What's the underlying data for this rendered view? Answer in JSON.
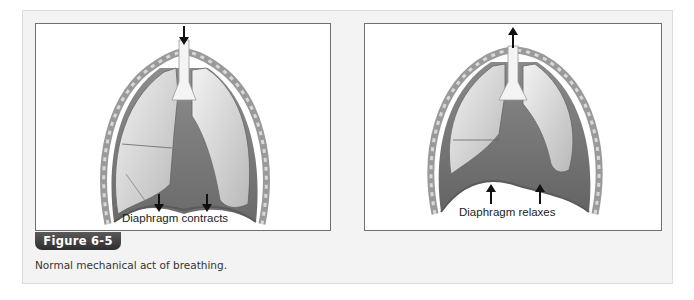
{
  "figure": {
    "number_label": "Figure 6-5",
    "caption": "Normal mechanical act of breathing."
  },
  "diagrams": [
    {
      "label": "Diaphragm contracts",
      "airflow_arrow": "arrow-down-icon",
      "diaphragm_arrows": [
        "arrow-down-icon",
        "arrow-down-icon"
      ]
    },
    {
      "label": "Diaphragm relaxes",
      "airflow_arrow": "arrow-up-icon",
      "diaphragm_arrows": [
        "arrow-up-icon",
        "arrow-up-icon"
      ]
    }
  ],
  "colors": {
    "tab_background": "#3a3a3a",
    "panel_background": "#f3f3f3",
    "box_border": "#6f6f6f"
  }
}
